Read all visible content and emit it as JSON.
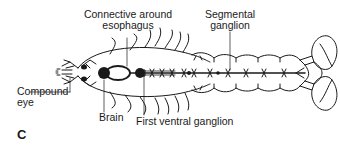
{
  "figure": {
    "panel_letter": "C",
    "labels": {
      "connective_line1": "Connective around",
      "connective_line2": "esophagus",
      "segmental_line1": "Segmental",
      "segmental_line2": "ganglion",
      "compound_eye_line1": "Compound",
      "compound_eye_line2": "eye",
      "brain": "Brain",
      "first_ventral": "First ventral ganglion"
    },
    "colors": {
      "ink": "#1a1a1a",
      "background": "#ffffff"
    }
  }
}
